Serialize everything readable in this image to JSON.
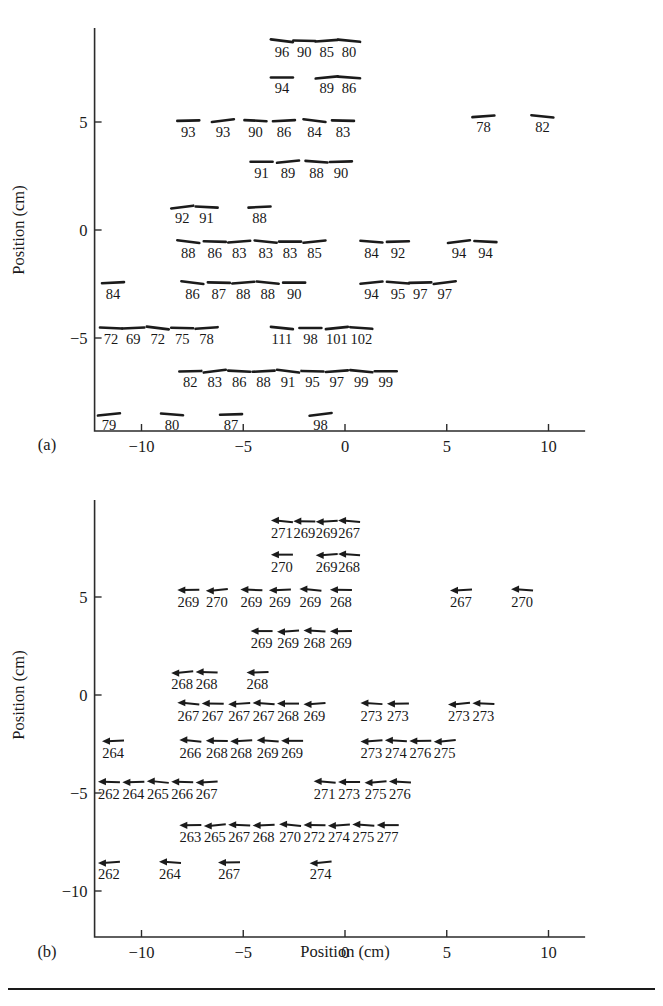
{
  "figure": {
    "background": "#ffffff",
    "ink_color": "#1a1a1a",
    "bottom_rule": true
  },
  "panels": [
    {
      "id": "a",
      "label": "(a)",
      "y_axis_title": "Position (cm)",
      "x_axis_title": "",
      "x_ticks": [
        "-10",
        "-5",
        "0",
        "5",
        "10"
      ],
      "y_ticks": [
        "5",
        "0",
        "-5"
      ],
      "marker_type": "line-segment"
    },
    {
      "id": "b",
      "label": "(b)",
      "y_axis_title": "Position (cm)",
      "x_axis_title": "Position (cm)",
      "x_ticks": [
        "-10",
        "-5",
        "0",
        "5",
        "10"
      ],
      "y_ticks": [
        "5",
        "0",
        "-5",
        "-10"
      ],
      "marker_type": "left-arrow"
    }
  ],
  "chart_data": [
    {
      "type": "scatter",
      "panel": "a",
      "title": "",
      "xlabel": "",
      "ylabel": "Position (cm)",
      "xlim": [
        -12.6,
        11.8
      ],
      "ylim": [
        -9.8,
        9.2
      ],
      "xticks": [
        -10,
        -5,
        0,
        5,
        10
      ],
      "yticks": [
        5,
        0,
        -5
      ],
      "grid": false,
      "legend": null,
      "marker": "short tilted line segment with numeric label beneath",
      "points": [
        {
          "x": -3.1,
          "y": 8.3,
          "label": "96"
        },
        {
          "x": -2.0,
          "y": 8.3,
          "label": "90"
        },
        {
          "x": -0.9,
          "y": 8.3,
          "label": "85"
        },
        {
          "x": 0.2,
          "y": 8.3,
          "label": "80"
        },
        {
          "x": -3.1,
          "y": 6.6,
          "label": "94"
        },
        {
          "x": -0.9,
          "y": 6.6,
          "label": "89"
        },
        {
          "x": 0.2,
          "y": 6.6,
          "label": "86"
        },
        {
          "x": -7.7,
          "y": 4.6,
          "label": "93"
        },
        {
          "x": -6.0,
          "y": 4.6,
          "label": "93"
        },
        {
          "x": -4.4,
          "y": 4.6,
          "label": "90"
        },
        {
          "x": -3.0,
          "y": 4.6,
          "label": "86"
        },
        {
          "x": -1.5,
          "y": 4.6,
          "label": "84"
        },
        {
          "x": -0.1,
          "y": 4.6,
          "label": "83"
        },
        {
          "x": 6.8,
          "y": 4.8,
          "label": "78"
        },
        {
          "x": 9.7,
          "y": 4.8,
          "label": "82"
        },
        {
          "x": -4.1,
          "y": 2.7,
          "label": "91"
        },
        {
          "x": -2.8,
          "y": 2.7,
          "label": "89"
        },
        {
          "x": -1.4,
          "y": 2.7,
          "label": "88"
        },
        {
          "x": -0.2,
          "y": 2.7,
          "label": "90"
        },
        {
          "x": -8.0,
          "y": 0.6,
          "label": "92"
        },
        {
          "x": -6.8,
          "y": 0.6,
          "label": "91"
        },
        {
          "x": -4.2,
          "y": 0.6,
          "label": "88"
        },
        {
          "x": -7.7,
          "y": -1.0,
          "label": "88"
        },
        {
          "x": -6.4,
          "y": -1.0,
          "label": "86"
        },
        {
          "x": -5.2,
          "y": -1.0,
          "label": "83"
        },
        {
          "x": -3.9,
          "y": -1.0,
          "label": "83"
        },
        {
          "x": -2.7,
          "y": -1.0,
          "label": "83"
        },
        {
          "x": -1.5,
          "y": -1.0,
          "label": "85"
        },
        {
          "x": 1.3,
          "y": -1.0,
          "label": "84"
        },
        {
          "x": 2.6,
          "y": -1.0,
          "label": "92"
        },
        {
          "x": 5.6,
          "y": -1.0,
          "label": "94"
        },
        {
          "x": 6.9,
          "y": -1.0,
          "label": "94"
        },
        {
          "x": -11.4,
          "y": -2.9,
          "label": "84"
        },
        {
          "x": -7.5,
          "y": -2.9,
          "label": "86"
        },
        {
          "x": -6.2,
          "y": -2.9,
          "label": "87"
        },
        {
          "x": -5.0,
          "y": -2.9,
          "label": "88"
        },
        {
          "x": -3.8,
          "y": -2.9,
          "label": "88"
        },
        {
          "x": -2.5,
          "y": -2.9,
          "label": "90"
        },
        {
          "x": 1.3,
          "y": -2.9,
          "label": "94"
        },
        {
          "x": 2.6,
          "y": -2.9,
          "label": "95"
        },
        {
          "x": 3.7,
          "y": -2.9,
          "label": "97"
        },
        {
          "x": 4.9,
          "y": -2.9,
          "label": "97"
        },
        {
          "x": -11.5,
          "y": -5.0,
          "label": "72"
        },
        {
          "x": -10.4,
          "y": -5.0,
          "label": "69"
        },
        {
          "x": -9.2,
          "y": -5.0,
          "label": "72"
        },
        {
          "x": -8.0,
          "y": -5.0,
          "label": "75"
        },
        {
          "x": -6.8,
          "y": -5.0,
          "label": "78"
        },
        {
          "x": -3.1,
          "y": -5.0,
          "label": "111"
        },
        {
          "x": -1.7,
          "y": -5.0,
          "label": "98"
        },
        {
          "x": -0.4,
          "y": -5.0,
          "label": "101"
        },
        {
          "x": 0.8,
          "y": -5.0,
          "label": "102"
        },
        {
          "x": -7.6,
          "y": -7.0,
          "label": "82"
        },
        {
          "x": -6.4,
          "y": -7.0,
          "label": "83"
        },
        {
          "x": -5.2,
          "y": -7.0,
          "label": "86"
        },
        {
          "x": -4.0,
          "y": -7.0,
          "label": "88"
        },
        {
          "x": -2.8,
          "y": -7.0,
          "label": "91"
        },
        {
          "x": -1.6,
          "y": -7.0,
          "label": "95"
        },
        {
          "x": -0.4,
          "y": -7.0,
          "label": "97"
        },
        {
          "x": 0.8,
          "y": -7.0,
          "label": "99"
        },
        {
          "x": 2.0,
          "y": -7.0,
          "label": "99"
        },
        {
          "x": -11.6,
          "y": -9.0,
          "label": "79"
        },
        {
          "x": -8.5,
          "y": -9.0,
          "label": "80"
        },
        {
          "x": -5.6,
          "y": -9.0,
          "label": "87"
        },
        {
          "x": -1.2,
          "y": -9.0,
          "label": "98"
        }
      ]
    },
    {
      "type": "scatter",
      "panel": "b",
      "title": "",
      "xlabel": "Position (cm)",
      "ylabel": "Position (cm)",
      "xlim": [
        -12.6,
        11.8
      ],
      "ylim": [
        -10.6,
        9.2
      ],
      "xticks": [
        -10,
        -5,
        0,
        5,
        10
      ],
      "yticks": [
        5,
        0,
        -5,
        -10
      ],
      "grid": false,
      "legend": null,
      "marker": "leftward arrow with numeric label beneath",
      "points": [
        {
          "x": -3.1,
          "y": 8.3,
          "label": "271"
        },
        {
          "x": -2.0,
          "y": 8.3,
          "label": "269"
        },
        {
          "x": -0.9,
          "y": 8.3,
          "label": "269"
        },
        {
          "x": 0.2,
          "y": 8.3,
          "label": "267"
        },
        {
          "x": -3.1,
          "y": 6.6,
          "label": "270"
        },
        {
          "x": -0.9,
          "y": 6.6,
          "label": "269"
        },
        {
          "x": 0.2,
          "y": 6.6,
          "label": "268"
        },
        {
          "x": -7.7,
          "y": 4.8,
          "label": "269"
        },
        {
          "x": -6.3,
          "y": 4.8,
          "label": "270"
        },
        {
          "x": -4.6,
          "y": 4.8,
          "label": "269"
        },
        {
          "x": -3.2,
          "y": 4.8,
          "label": "269"
        },
        {
          "x": -1.7,
          "y": 4.8,
          "label": "269"
        },
        {
          "x": -0.2,
          "y": 4.8,
          "label": "268"
        },
        {
          "x": 5.7,
          "y": 4.8,
          "label": "267"
        },
        {
          "x": 8.7,
          "y": 4.8,
          "label": "270"
        },
        {
          "x": -4.1,
          "y": 2.7,
          "label": "269"
        },
        {
          "x": -2.8,
          "y": 2.7,
          "label": "269"
        },
        {
          "x": -1.5,
          "y": 2.7,
          "label": "268"
        },
        {
          "x": -0.2,
          "y": 2.7,
          "label": "269"
        },
        {
          "x": -8.0,
          "y": 0.6,
          "label": "268"
        },
        {
          "x": -6.8,
          "y": 0.6,
          "label": "268"
        },
        {
          "x": -4.3,
          "y": 0.6,
          "label": "268"
        },
        {
          "x": -7.7,
          "y": -1.0,
          "label": "267"
        },
        {
          "x": -6.5,
          "y": -1.0,
          "label": "267"
        },
        {
          "x": -5.2,
          "y": -1.0,
          "label": "267"
        },
        {
          "x": -4.0,
          "y": -1.0,
          "label": "267"
        },
        {
          "x": -2.8,
          "y": -1.0,
          "label": "268"
        },
        {
          "x": -1.5,
          "y": -1.0,
          "label": "269"
        },
        {
          "x": 1.3,
          "y": -1.0,
          "label": "273"
        },
        {
          "x": 2.6,
          "y": -1.0,
          "label": "273"
        },
        {
          "x": 5.6,
          "y": -1.0,
          "label": "273"
        },
        {
          "x": 6.8,
          "y": -1.0,
          "label": "273"
        },
        {
          "x": -11.4,
          "y": -2.9,
          "label": "264"
        },
        {
          "x": -7.6,
          "y": -2.9,
          "label": "266"
        },
        {
          "x": -6.3,
          "y": -2.9,
          "label": "268"
        },
        {
          "x": -5.1,
          "y": -2.9,
          "label": "268"
        },
        {
          "x": -3.8,
          "y": -2.9,
          "label": "269"
        },
        {
          "x": -2.6,
          "y": -2.9,
          "label": "269"
        },
        {
          "x": 1.3,
          "y": -2.9,
          "label": "273"
        },
        {
          "x": 2.5,
          "y": -2.9,
          "label": "274"
        },
        {
          "x": 3.7,
          "y": -2.9,
          "label": "276"
        },
        {
          "x": 4.9,
          "y": -2.9,
          "label": "275"
        },
        {
          "x": -11.6,
          "y": -5.0,
          "label": "262"
        },
        {
          "x": -10.4,
          "y": -5.0,
          "label": "264"
        },
        {
          "x": -9.2,
          "y": -5.0,
          "label": "265"
        },
        {
          "x": -8.0,
          "y": -5.0,
          "label": "266"
        },
        {
          "x": -6.8,
          "y": -5.0,
          "label": "267"
        },
        {
          "x": -1.0,
          "y": -5.0,
          "label": "271"
        },
        {
          "x": 0.2,
          "y": -5.0,
          "label": "273"
        },
        {
          "x": 1.5,
          "y": -5.0,
          "label": "275"
        },
        {
          "x": 2.7,
          "y": -5.0,
          "label": "276"
        },
        {
          "x": -7.6,
          "y": -7.2,
          "label": "263"
        },
        {
          "x": -6.4,
          "y": -7.2,
          "label": "265"
        },
        {
          "x": -5.2,
          "y": -7.2,
          "label": "267"
        },
        {
          "x": -4.0,
          "y": -7.2,
          "label": "268"
        },
        {
          "x": -2.7,
          "y": -7.2,
          "label": "270"
        },
        {
          "x": -1.5,
          "y": -7.2,
          "label": "272"
        },
        {
          "x": -0.3,
          "y": -7.2,
          "label": "274"
        },
        {
          "x": 0.9,
          "y": -7.2,
          "label": "275"
        },
        {
          "x": 2.1,
          "y": -7.2,
          "label": "277"
        },
        {
          "x": -11.6,
          "y": -9.1,
          "label": "262"
        },
        {
          "x": -8.6,
          "y": -9.1,
          "label": "264"
        },
        {
          "x": -5.7,
          "y": -9.1,
          "label": "267"
        },
        {
          "x": -1.2,
          "y": -9.1,
          "label": "274"
        }
      ]
    }
  ]
}
